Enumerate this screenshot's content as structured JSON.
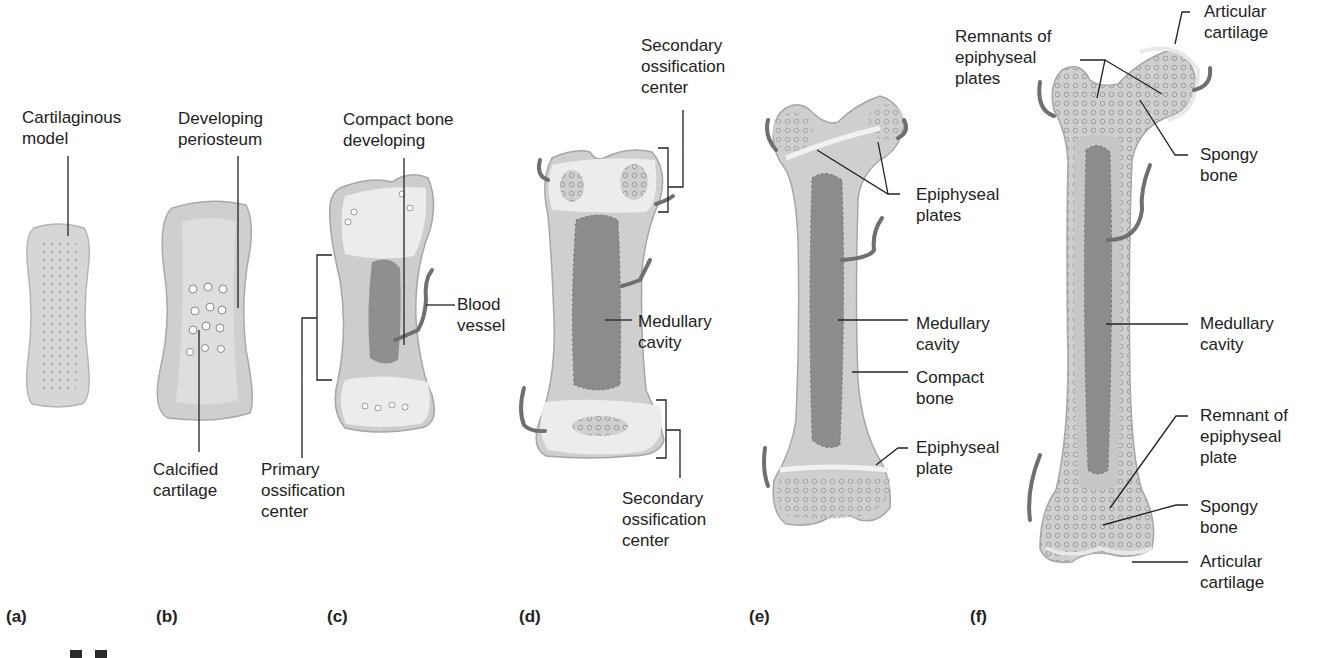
{
  "figure": {
    "panels": [
      {
        "id": "a",
        "label": "(a)",
        "stage": "Cartilaginous model",
        "annotations": [
          "Cartilaginous model"
        ]
      },
      {
        "id": "b",
        "label": "(b)",
        "annotations": [
          "Developing periosteum",
          "Calcified cartilage"
        ]
      },
      {
        "id": "c",
        "label": "(c)",
        "annotations": [
          "Compact bone developing",
          "Blood vessel",
          "Primary ossification center"
        ]
      },
      {
        "id": "d",
        "label": "(d)",
        "annotations": [
          "Secondary ossification center (top)",
          "Medullary cavity",
          "Secondary ossification center (bottom)"
        ]
      },
      {
        "id": "e",
        "label": "(e)",
        "annotations": [
          "Epiphyseal plates",
          "Medullary cavity",
          "Compact bone",
          "Epiphyseal plate"
        ]
      },
      {
        "id": "f",
        "label": "(f)",
        "annotations": [
          "Remnants of epiphyseal plates",
          "Articular cartilage",
          "Spongy bone",
          "Medullary cavity",
          "Remnant of epiphyseal plate",
          "Spongy bone",
          "Articular cartilage"
        ]
      }
    ],
    "labels": {
      "a_cartilaginous_model": "Cartilaginous\nmodel",
      "b_developing_periosteum": "Developing\nperiosteum",
      "b_calcified_cartilage": "Calcified\ncartilage",
      "c_compact_bone_developing": "Compact bone\ndeveloping",
      "c_blood_vessel": "Blood\nvessel",
      "c_primary_ossification_center": "Primary\nossification\ncenter",
      "d_secondary_ossification_top": "Secondary\nossification\ncenter",
      "d_medullary_cavity": "Medullary\ncavity",
      "d_secondary_ossification_bottom": "Secondary\nossification\ncenter",
      "e_epiphyseal_plates": "Epiphyseal\nplates",
      "e_medullary_cavity": "Medullary\ncavity",
      "e_compact_bone": "Compact\nbone",
      "e_epiphyseal_plate": "Epiphyseal\nplate",
      "f_remnants_of_epiphyseal_plates": "Remnants of\nepiphyseal\nplates",
      "f_articular_cartilage_top": "Articular\ncartilage",
      "f_spongy_bone_top": "Spongy\nbone",
      "f_medullary_cavity": "Medullary\ncavity",
      "f_remnant_of_epiphyseal_plate": "Remnant of\nepiphyseal\nplate",
      "f_spongy_bone_bottom": "Spongy\nbone",
      "f_articular_cartilage_bottom": "Articular\ncartilage"
    },
    "panel_labels": {
      "a": "(a)",
      "b": "(b)",
      "c": "(c)",
      "d": "(d)",
      "e": "(e)",
      "f": "(f)"
    },
    "colors": {
      "bone_fill": "#d4d4d4",
      "bone_edge": "#a8a8a8",
      "cartilage_fill": "#e9e9e9",
      "marrow_fill": "#8e8e8e",
      "vessel": "#6f6f6f",
      "text": "#222222",
      "background": "#ffffff"
    }
  }
}
